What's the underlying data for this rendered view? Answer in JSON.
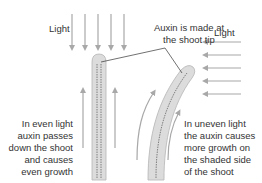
{
  "diagram": {
    "labels": {
      "light_left": "Light",
      "light_right": "Light",
      "auxin_tip_line1": "Auxin is made at",
      "auxin_tip_line2": "the shoot tip",
      "even_light": [
        "In even light",
        "auxin passes",
        "down the shoot",
        "and causes",
        "even growth"
      ],
      "uneven_light": [
        "In uneven light",
        "the auxin causes",
        "more growth on",
        "the shaded side",
        "of the shoot"
      ]
    },
    "colors": {
      "arrow": "#a8a8a8",
      "shoot_fill": "#dcdcdc",
      "shoot_stroke": "#b5b5b5",
      "auxin_line": "#555555",
      "callout_line": "#333333",
      "text": "#333333"
    },
    "icons": {
      "light_from_above": "down-arrow-icon x5",
      "light_from_right": "left-arrow-icon x5",
      "growth_arrows": "up-arrow-icon"
    }
  }
}
